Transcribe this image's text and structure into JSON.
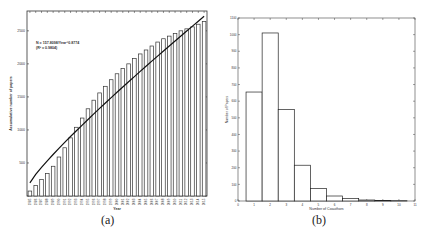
{
  "captions": {
    "a": "(a)",
    "b": "(b)"
  },
  "chart_data": [
    {
      "id": "a",
      "type": "bar",
      "title": "",
      "xlabel": "Year",
      "ylabel": "Accumulative number of papers",
      "ylim": [
        0,
        2800
      ],
      "yticks": [
        0,
        500,
        1000,
        1500,
        2000,
        2500
      ],
      "grid": false,
      "annotation": [
        "N = 157.8098/Year^0.8774",
        "(R² = 0.9804)"
      ],
      "categories": [
        "1985",
        "1986",
        "1987",
        "1988",
        "1989",
        "1990",
        "1991",
        "1992",
        "1993",
        "1994",
        "1995",
        "1996",
        "1997",
        "1998",
        "1999",
        "2000",
        "2001",
        "2002",
        "2003",
        "2004",
        "2005",
        "2006",
        "2007",
        "2008",
        "2009",
        "2010",
        "2011",
        "2012",
        "2013",
        "2014",
        "2015"
      ],
      "values": [
        75,
        160,
        250,
        340,
        450,
        590,
        730,
        880,
        1040,
        1180,
        1320,
        1450,
        1560,
        1660,
        1760,
        1850,
        1930,
        2000,
        2080,
        2150,
        2210,
        2270,
        2330,
        2380,
        2420,
        2460,
        2500,
        2530,
        2560,
        2600,
        2640
      ],
      "fit_line": {
        "name": "power-law fit",
        "start": [
          1985,
          200
        ],
        "end": [
          2015,
          2720
        ]
      }
    },
    {
      "id": "b",
      "type": "bar",
      "title": "",
      "xlabel": "Number of Coauthors",
      "ylabel": "Number of Papers",
      "xlim": [
        0,
        11
      ],
      "ylim": [
        0,
        1100
      ],
      "xticks": [
        0,
        1,
        2,
        3,
        4,
        5,
        6,
        7,
        8,
        9,
        10,
        11
      ],
      "yticks": [
        0,
        100,
        200,
        300,
        400,
        500,
        600,
        700,
        800,
        900,
        1000,
        1100
      ],
      "grid": false,
      "categories": [
        "1",
        "2",
        "3",
        "4",
        "5",
        "6",
        "7",
        "8",
        "9",
        "10"
      ],
      "values": [
        655,
        1010,
        550,
        215,
        75,
        30,
        15,
        6,
        3,
        2
      ]
    }
  ]
}
